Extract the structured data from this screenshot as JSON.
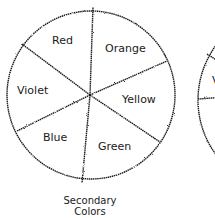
{
  "diagram": {
    "type": "color-wheel",
    "caption_line1": "Secondary",
    "caption_line2": "Colors",
    "segments": [
      {
        "label": "Red"
      },
      {
        "label": "Orange"
      },
      {
        "label": "Yellow"
      },
      {
        "label": "Green"
      },
      {
        "label": "Blue"
      },
      {
        "label": "Violet"
      }
    ],
    "second_wheel_partial_label": "V"
  },
  "colors": {
    "ink": "#1a1a1a",
    "background": "#ffffff"
  }
}
